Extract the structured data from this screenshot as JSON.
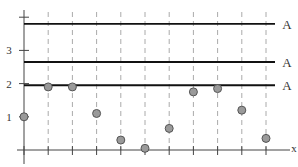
{
  "chart_data": {
    "type": "scatter",
    "title": "",
    "xlabel": "x",
    "ylabel": "",
    "ylim": [
      0,
      4
    ],
    "grid": "vertical dashed lines at each x tick",
    "y_ticks": [
      {
        "value": 1,
        "label": "1"
      },
      {
        "value": 2,
        "label": "2"
      },
      {
        "value": 3,
        "label": "3"
      },
      {
        "value": 4,
        "label": ""
      }
    ],
    "x": [
      0,
      1,
      2,
      3,
      4,
      5,
      6,
      7,
      8,
      9,
      10
    ],
    "values": [
      1.0,
      1.9,
      1.9,
      1.1,
      0.3,
      0.05,
      0.65,
      1.75,
      1.85,
      1.2,
      0.35
    ],
    "reference_lines": [
      {
        "y": 3.8,
        "label": "A"
      },
      {
        "y": 2.65,
        "label": "A"
      },
      {
        "y": 1.95,
        "label": "A"
      }
    ],
    "colors": {
      "point_fill": "#9a9a9a",
      "point_stroke": "#555555",
      "line": "#111111",
      "grid": "#aaaaaa",
      "axis": "#444444"
    }
  }
}
